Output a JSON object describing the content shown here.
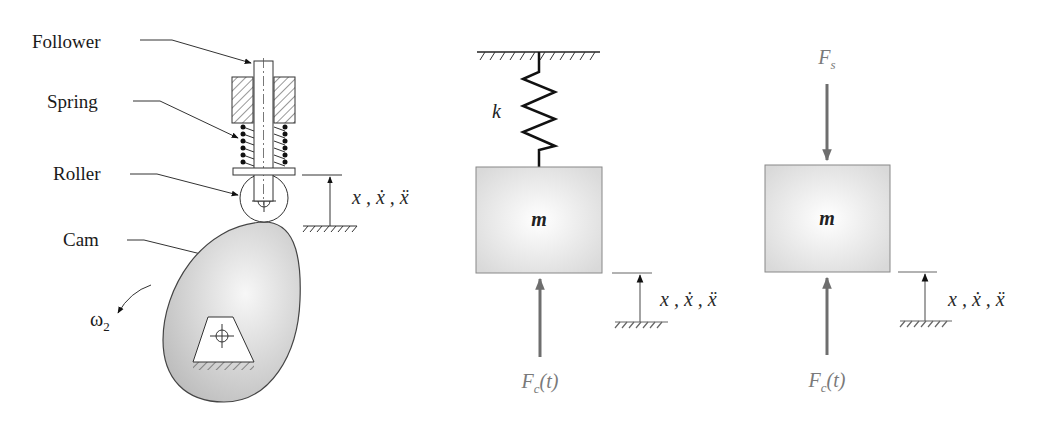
{
  "figure": {
    "panels": [
      {
        "id": "cam-follower",
        "labels": {
          "follower": "Follower",
          "spring": "Spring",
          "roller": "Roller",
          "cam": "Cam",
          "omega": "ω",
          "omega_sub": "2",
          "displacement": "x , ẋ , ẍ"
        }
      },
      {
        "id": "spring-mass-model",
        "labels": {
          "spring_constant": "k",
          "mass": "m",
          "force_symbol": "F",
          "force_sub": "c",
          "force_arg": "(t)",
          "displacement": "x , ẋ , ẍ"
        }
      },
      {
        "id": "free-body-diagram",
        "labels": {
          "spring_force_symbol": "F",
          "spring_force_sub": "s",
          "mass": "m",
          "force_symbol": "F",
          "force_sub": "c",
          "force_arg": "(t)",
          "displacement": "x , ẋ , ẍ"
        }
      }
    ]
  },
  "colors": {
    "mass_fill": "#e2e2e2",
    "cam_fill": "#cfcfcf",
    "force_arrow": "#6e6e6e",
    "label_gray": "#7a7a7a"
  }
}
